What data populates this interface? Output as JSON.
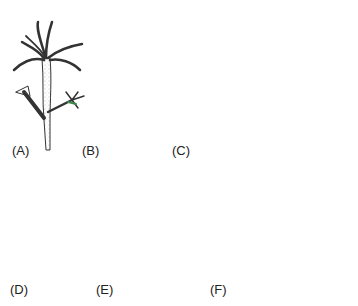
{
  "figure": {
    "panels": [
      {
        "id": "A",
        "label": "(A)",
        "subject": "polyp with tentacles and budding branches"
      },
      {
        "id": "B",
        "label": "(B)",
        "subject": "nematocysts with long discharged threads"
      },
      {
        "id": "C",
        "label": "(C)",
        "subject": "medusa with fringed tentacle margin"
      },
      {
        "id": "D",
        "label": "(D)",
        "subject": "branched colonial hydroid"
      },
      {
        "id": "E",
        "label": "(E)",
        "subject": "encrusting organism on substrate at water surface"
      },
      {
        "id": "F",
        "label": "(F)",
        "subject": "spicules: long rod, amphidisc, curved rod, star"
      }
    ]
  },
  "colors": {
    "ink": "#333333",
    "shade": "#888888",
    "accent_green": "#3a8a4a",
    "accent_red": "#c0392b",
    "background": "#ffffff"
  }
}
